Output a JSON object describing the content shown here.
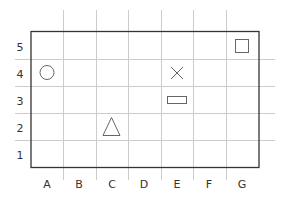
{
  "grid": {
    "columns": [
      "A",
      "B",
      "C",
      "D",
      "E",
      "F",
      "G"
    ],
    "rows": [
      "5",
      "4",
      "3",
      "2",
      "1"
    ],
    "colors": {
      "border": "#333333",
      "gridline": "#cccccc",
      "shape": "#666666",
      "label": "#333333"
    }
  },
  "shapes": [
    {
      "type": "circle",
      "cell": "A4"
    },
    {
      "type": "cross",
      "cell": "E4"
    },
    {
      "type": "rectangle",
      "cell": "E3"
    },
    {
      "type": "square",
      "cell": "G5"
    },
    {
      "type": "triangle",
      "cell": "C2"
    }
  ]
}
